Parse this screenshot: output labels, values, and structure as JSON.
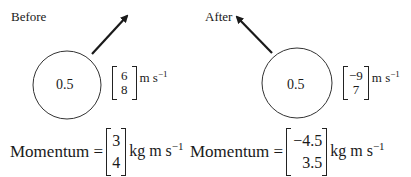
{
  "before": {
    "title": "Before",
    "mass": "0.5",
    "velocity": {
      "x": "6",
      "y": "8"
    },
    "velocity_unit": "m s",
    "velocity_unit_exp": "−1",
    "momentum_label": "Momentum =",
    "momentum": {
      "x": "3",
      "y": "4"
    },
    "momentum_unit": "kg m s",
    "momentum_unit_exp": "−1"
  },
  "after": {
    "title": "After",
    "mass": "0.5",
    "velocity": {
      "x": "−9",
      "y": "7"
    },
    "velocity_unit": "m s",
    "velocity_unit_exp": "−1",
    "momentum_label": "Momentum =",
    "momentum": {
      "x": "−4.5",
      "y": "3.5"
    },
    "momentum_unit": "kg m s",
    "momentum_unit_exp": "−1"
  },
  "colors": {
    "stroke": "#1a1a1a",
    "background": "#ffffff"
  }
}
